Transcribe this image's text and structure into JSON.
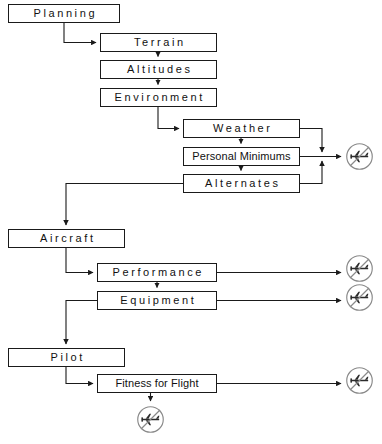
{
  "diagram": {
    "stroke_color": "#1a1a1a",
    "icon_color": "#6b6b6b",
    "background_color": "#ffffff",
    "nodes": [
      {
        "id": "planning",
        "label": "Planning",
        "style": "spaced",
        "x": 8,
        "y": 4,
        "w": 112,
        "h": 19
      },
      {
        "id": "terrain",
        "label": "Terrain",
        "style": "spaced",
        "x": 100,
        "y": 33,
        "w": 117,
        "h": 19
      },
      {
        "id": "altitudes",
        "label": "Altitudes",
        "style": "spaced",
        "x": 100,
        "y": 60,
        "w": 117,
        "h": 19
      },
      {
        "id": "environment",
        "label": "Environment",
        "style": "spaced",
        "x": 100,
        "y": 88,
        "w": 117,
        "h": 19
      },
      {
        "id": "weather",
        "label": "Weather",
        "style": "spaced",
        "x": 183,
        "y": 119,
        "w": 117,
        "h": 19
      },
      {
        "id": "minimums",
        "label": "Personal Minimums",
        "style": "tight",
        "x": 183,
        "y": 147,
        "w": 117,
        "h": 19
      },
      {
        "id": "alternates",
        "label": "Alternates",
        "style": "spaced",
        "x": 183,
        "y": 174,
        "w": 117,
        "h": 19
      },
      {
        "id": "aircraft",
        "label": "Aircraft",
        "style": "spaced",
        "x": 8,
        "y": 229,
        "w": 117,
        "h": 19
      },
      {
        "id": "performance",
        "label": "Performance",
        "style": "spaced",
        "x": 97,
        "y": 263,
        "w": 120,
        "h": 19
      },
      {
        "id": "equipment",
        "label": "Equipment",
        "style": "spaced",
        "x": 97,
        "y": 291,
        "w": 120,
        "h": 19
      },
      {
        "id": "pilot",
        "label": "Pilot",
        "style": "spaced",
        "x": 8,
        "y": 348,
        "w": 117,
        "h": 19
      },
      {
        "id": "fitness",
        "label": "Fitness for Flight",
        "style": "tight",
        "x": 97,
        "y": 374,
        "w": 120,
        "h": 19
      }
    ],
    "decision_icons": [
      {
        "id": "nofly-weather-block",
        "name": "no-fly-decision-icon",
        "x": 345,
        "y": 142,
        "size": 29
      },
      {
        "id": "nofly-performance",
        "name": "no-fly-decision-icon",
        "x": 345,
        "y": 254,
        "size": 29
      },
      {
        "id": "nofly-equipment",
        "name": "no-fly-decision-icon",
        "x": 345,
        "y": 283,
        "size": 29
      },
      {
        "id": "nofly-fitness-right",
        "name": "no-fly-decision-icon",
        "x": 345,
        "y": 366,
        "size": 29
      },
      {
        "id": "nofly-fitness-down",
        "name": "no-fly-decision-icon",
        "x": 136,
        "y": 405,
        "size": 29
      }
    ],
    "connections": [
      {
        "from": "planning",
        "to": "terrain",
        "label": "Planning to Terrain"
      },
      {
        "from": "terrain",
        "to": "altitudes",
        "label": "Terrain to Altitudes"
      },
      {
        "from": "altitudes",
        "to": "environment",
        "label": "Altitudes to Environment"
      },
      {
        "from": "environment",
        "to": "weather",
        "label": "Environment to Weather"
      },
      {
        "from": "weather",
        "to": "minimums",
        "label": "Weather to Personal Minimums"
      },
      {
        "from": "minimums",
        "to": "alternates",
        "label": "Personal Minimums to Alternates"
      },
      {
        "from": "weather",
        "to": "nofly-weather-block",
        "label": "Weather to no-go decision"
      },
      {
        "from": "minimums",
        "to": "nofly-weather-block",
        "label": "Personal Minimums to no-go decision"
      },
      {
        "from": "alternates",
        "to": "nofly-weather-block",
        "label": "Alternates to no-go decision"
      },
      {
        "from": "alternates",
        "to": "aircraft",
        "label": "Alternates to Aircraft"
      },
      {
        "from": "aircraft",
        "to": "performance",
        "label": "Aircraft to Performance"
      },
      {
        "from": "performance",
        "to": "equipment",
        "label": "Performance to Equipment"
      },
      {
        "from": "performance",
        "to": "nofly-performance",
        "label": "Performance to no-go decision"
      },
      {
        "from": "equipment",
        "to": "nofly-equipment",
        "label": "Equipment to no-go decision"
      },
      {
        "from": "equipment",
        "to": "pilot",
        "label": "Equipment to Pilot"
      },
      {
        "from": "pilot",
        "to": "fitness",
        "label": "Pilot to Fitness for Flight"
      },
      {
        "from": "fitness",
        "to": "nofly-fitness-right",
        "label": "Fitness for Flight to no-go decision"
      },
      {
        "from": "fitness",
        "to": "nofly-fitness-down",
        "label": "Fitness for Flight to no-go decision"
      }
    ]
  }
}
